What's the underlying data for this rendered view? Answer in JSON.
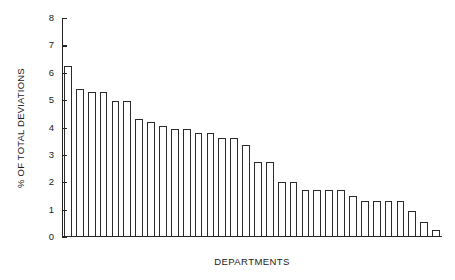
{
  "chart_data": {
    "type": "bar",
    "title": "",
    "subtitle": "",
    "xlabel": "DEPARTMENTS",
    "ylabel": "% OF TOTAL DEVIATIONS",
    "ylim": [
      0,
      8
    ],
    "yticks": [
      0,
      1,
      2,
      3,
      4,
      5,
      6,
      7,
      8
    ],
    "ytick_labels": [
      "0",
      "1",
      "2",
      "3",
      "4",
      "5",
      "6",
      "7",
      "8"
    ],
    "xtick_labels": [],
    "grid": false,
    "legend": null,
    "legend_position": "none",
    "bar_style": {
      "fill": "#ffffff",
      "edge": "#2a2a2a",
      "edge_width_px": 1.2
    },
    "categories": [
      "D1",
      "D2",
      "D3",
      "D4",
      "D5",
      "D6",
      "D7",
      "D8",
      "D9",
      "D10",
      "D11",
      "D12",
      "D13",
      "D14",
      "D15",
      "D16",
      "D17",
      "D18",
      "D19",
      "D20",
      "D21",
      "D22",
      "D23",
      "D24",
      "D25",
      "D26",
      "D27",
      "D28",
      "D29",
      "D30",
      "D31",
      "D32"
    ],
    "values": [
      6.2,
      5.35,
      5.25,
      5.25,
      4.9,
      4.9,
      4.25,
      4.15,
      4.0,
      3.9,
      3.9,
      3.75,
      3.75,
      3.55,
      3.55,
      3.3,
      2.7,
      2.7,
      1.95,
      1.95,
      1.65,
      1.65,
      1.65,
      1.65,
      1.45,
      1.25,
      1.25,
      1.25,
      1.25,
      0.9,
      0.5,
      0.2
    ]
  },
  "axes": {
    "y_title": "% OF TOTAL DEVIATIONS",
    "x_title": "DEPARTMENTS"
  }
}
